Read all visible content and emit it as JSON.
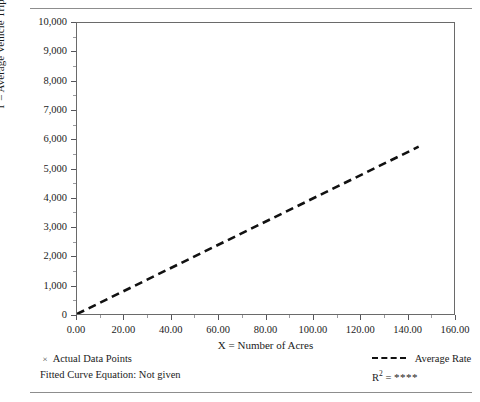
{
  "figure": {
    "cut_off_header": "",
    "legend": {
      "data_points_label": "Actual Data Points",
      "data_points_marker": "x-marker-icon",
      "fitted_curve_label": "Fitted Curve Equation: Not given",
      "average_rate_label": "Average Rate",
      "average_rate_marker": "dashed-line-icon",
      "r_squared_prefix": "R",
      "r_squared_exponent": "2",
      "r_squared_equals": "=",
      "r_squared_value": "****"
    }
  },
  "chart_data": {
    "type": "scatter",
    "title": "",
    "xlabel": "X = Number of Acres",
    "ylabel": "T = Average Vehicle Trip Ends",
    "xlim": [
      0,
      160
    ],
    "ylim": [
      0,
      10000
    ],
    "xticks": [
      0,
      20,
      40,
      60,
      80,
      100,
      120,
      140,
      160
    ],
    "xtick_labels": [
      "0.00",
      "20.00",
      "40.00",
      "60.00",
      "80.00",
      "100.00",
      "120.00",
      "140.00",
      "160.00"
    ],
    "yticks": [
      0,
      1000,
      2000,
      3000,
      4000,
      5000,
      6000,
      7000,
      8000,
      9000,
      10000
    ],
    "ytick_labels": [
      "0",
      "1,000",
      "2,000",
      "3,000",
      "4,000",
      "5,000",
      "6,000",
      "7,000",
      "8,000",
      "9,000",
      "10,000"
    ],
    "grid": false,
    "legend_position": "below-axes",
    "marker": "x",
    "marker_color": "#55555a",
    "series": [
      {
        "name": "Actual Data Points",
        "type": "scatter",
        "points": [
          [
            0.4,
            40
          ],
          [
            0.6,
            70
          ],
          [
            0.8,
            55
          ],
          [
            1.0,
            110
          ],
          [
            1.1,
            30
          ],
          [
            1.3,
            150
          ],
          [
            1.5,
            90
          ],
          [
            1.6,
            220
          ],
          [
            1.8,
            60
          ],
          [
            2.0,
            170
          ],
          [
            2.2,
            260
          ],
          [
            2.4,
            120
          ],
          [
            2.6,
            300
          ],
          [
            2.8,
            80
          ],
          [
            3.0,
            200
          ],
          [
            3.2,
            340
          ],
          [
            3.5,
            150
          ],
          [
            3.8,
            260
          ],
          [
            4.0,
            420
          ],
          [
            4.3,
            110
          ],
          [
            4.6,
            300
          ],
          [
            5.0,
            480
          ],
          [
            5.3,
            200
          ],
          [
            5.6,
            360
          ],
          [
            6.0,
            540
          ],
          [
            6.4,
            250
          ],
          [
            6.8,
            430
          ],
          [
            7.2,
            620
          ],
          [
            7.6,
            300
          ],
          [
            8.0,
            700
          ],
          [
            8.4,
            380
          ],
          [
            8.8,
            560
          ],
          [
            9.2,
            820
          ],
          [
            9.6,
            430
          ],
          [
            10.0,
            640
          ],
          [
            10.5,
            1100
          ],
          [
            11.0,
            900
          ],
          [
            11.5,
            500
          ],
          [
            12.0,
            760
          ],
          [
            12.5,
            1180
          ],
          [
            13.0,
            640
          ],
          [
            13.5,
            1050
          ],
          [
            14.0,
            860
          ],
          [
            14.5,
            420
          ],
          [
            15.0,
            1150
          ],
          [
            15.5,
            700
          ],
          [
            16.0,
            980
          ],
          [
            17.0,
            560
          ],
          [
            18.0,
            1250
          ],
          [
            19.0,
            820
          ],
          [
            20.0,
            1460
          ],
          [
            20.5,
            980
          ],
          [
            21.0,
            640
          ],
          [
            22.0,
            1180
          ],
          [
            23.0,
            380
          ],
          [
            24.0,
            860
          ],
          [
            25.0,
            1320
          ],
          [
            26.0,
            540
          ],
          [
            27.0,
            1050
          ],
          [
            28.0,
            2200
          ],
          [
            28.5,
            1420
          ],
          [
            29.0,
            900
          ],
          [
            30.0,
            1650
          ],
          [
            30.5,
            3780
          ],
          [
            31.0,
            4300
          ],
          [
            31.5,
            1180
          ],
          [
            32.0,
            1550
          ],
          [
            33.0,
            1350
          ],
          [
            34.0,
            1020
          ],
          [
            35.0,
            1480
          ],
          [
            36.0,
            860
          ],
          [
            38.0,
            1230
          ],
          [
            40.0,
            1050
          ],
          [
            42.0,
            500
          ],
          [
            45.0,
            180
          ],
          [
            47.0,
            5450
          ],
          [
            52.0,
            180
          ],
          [
            75.0,
            9550
          ],
          [
            97.0,
            1100
          ],
          [
            104.0,
            250
          ],
          [
            113.0,
            8800
          ],
          [
            113.5,
            750
          ],
          [
            128.0,
            250
          ],
          [
            143.0,
            7350
          ],
          [
            152.0,
            3450
          ],
          [
            152.5,
            400
          ]
        ]
      },
      {
        "name": "Average Rate",
        "type": "line",
        "style": "dashed",
        "color": "#111111",
        "x": [
          0,
          145
        ],
        "y": [
          0,
          5750
        ],
        "slope_trips_per_acre": 39.7
      }
    ]
  }
}
